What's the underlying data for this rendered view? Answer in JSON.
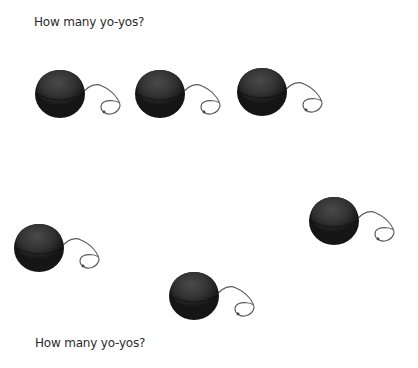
{
  "prompt_top": "How many yo-yos?",
  "prompt_bottom": "How many yo-yos?",
  "yoyo_count": 6,
  "colors": {
    "yoyo_body": "#1f1f1f",
    "yoyo_face": "#3a3a3a",
    "string": "#555555"
  },
  "yoyos": [
    {
      "id": 1,
      "icon": "yoyo-icon",
      "x": 34,
      "y": 66
    },
    {
      "id": 2,
      "icon": "yoyo-icon",
      "x": 134,
      "y": 66
    },
    {
      "id": 3,
      "icon": "yoyo-icon",
      "x": 236,
      "y": 64
    },
    {
      "id": 4,
      "icon": "yoyo-icon",
      "x": 13,
      "y": 220
    },
    {
      "id": 5,
      "icon": "yoyo-icon",
      "x": 168,
      "y": 268
    },
    {
      "id": 6,
      "icon": "yoyo-icon",
      "x": 308,
      "y": 193
    }
  ]
}
